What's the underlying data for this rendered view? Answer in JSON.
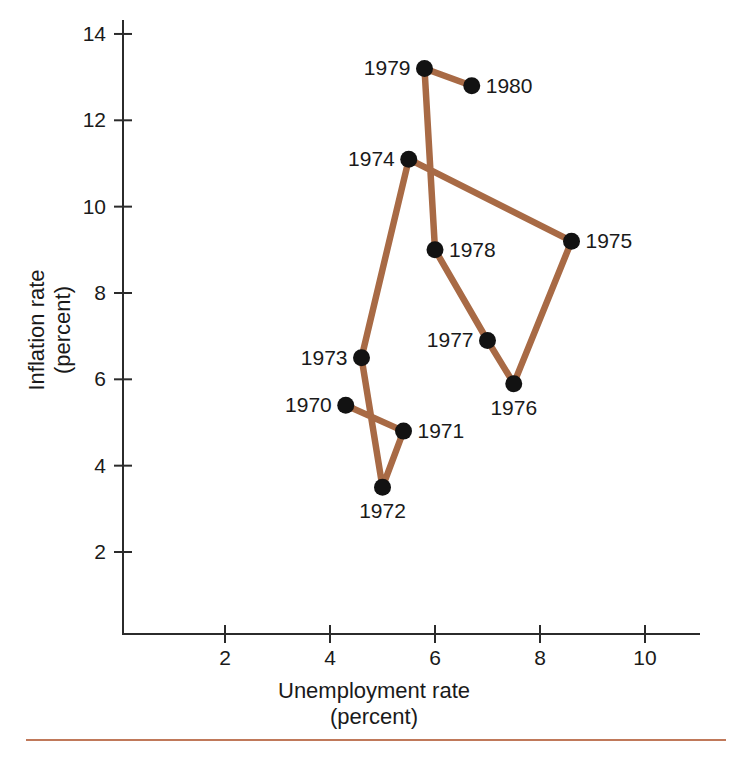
{
  "figure": {
    "line_color": "#a86a45",
    "dot_color": "#121212",
    "axis_color": "#2b2b2b",
    "rule_color": "#c0795a"
  },
  "axes": {
    "x": {
      "title_line1": "Unemployment rate",
      "title_line2": "(percent)",
      "ticks": [
        "2",
        "4",
        "6",
        "8",
        "10"
      ],
      "tick_values": [
        2,
        4,
        6,
        8,
        10
      ],
      "range": [
        0.6,
        11.3
      ]
    },
    "y": {
      "title_line1": "Inflation rate",
      "title_line2": "(percent)",
      "ticks": [
        "2",
        "4",
        "6",
        "8",
        "10",
        "12",
        "14"
      ],
      "tick_values": [
        2,
        4,
        6,
        8,
        10,
        12,
        14
      ],
      "range": [
        0.3,
        14.6
      ]
    }
  },
  "chart_data": {
    "type": "scatter",
    "title": "",
    "xlabel": "Unemployment rate (percent)",
    "ylabel": "Inflation rate (percent)",
    "xlim": [
      0.6,
      11.3
    ],
    "ylim": [
      0.3,
      14.6
    ],
    "grid": false,
    "legend": "none",
    "connected": true,
    "series": [
      {
        "name": "Inflation vs unemployment, 1970-1980",
        "points": [
          {
            "label": "1970",
            "x": 4.3,
            "y": 5.4,
            "label_side": "left"
          },
          {
            "label": "1971",
            "x": 5.4,
            "y": 4.8,
            "label_side": "right"
          },
          {
            "label": "1972",
            "x": 5.0,
            "y": 3.5,
            "label_side": "below"
          },
          {
            "label": "1973",
            "x": 4.6,
            "y": 6.5,
            "label_side": "left"
          },
          {
            "label": "1974",
            "x": 5.5,
            "y": 11.1,
            "label_side": "left"
          },
          {
            "label": "1975",
            "x": 8.6,
            "y": 9.2,
            "label_side": "right"
          },
          {
            "label": "1976",
            "x": 7.5,
            "y": 5.9,
            "label_side": "below"
          },
          {
            "label": "1977",
            "x": 7.0,
            "y": 6.9,
            "label_side": "left"
          },
          {
            "label": "1978",
            "x": 6.0,
            "y": 9.0,
            "label_side": "right"
          },
          {
            "label": "1979",
            "x": 5.8,
            "y": 13.2,
            "label_side": "left"
          },
          {
            "label": "1980",
            "x": 6.7,
            "y": 12.8,
            "label_side": "right"
          }
        ]
      }
    ]
  }
}
